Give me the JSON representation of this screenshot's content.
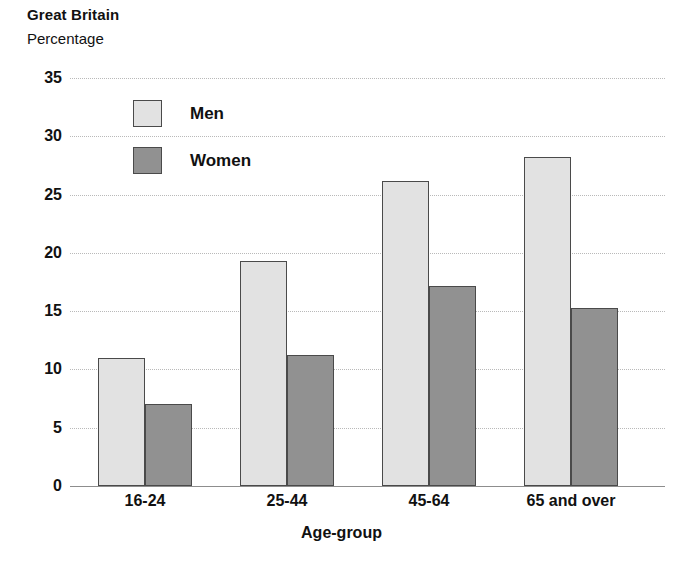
{
  "chart_data": {
    "type": "bar",
    "title": "Great Britain",
    "subtitle": "Percentage",
    "xlabel": "Age-group",
    "ylabel": "",
    "categories": [
      "16-24",
      "25-44",
      "45-64",
      "65 and over"
    ],
    "series": [
      {
        "name": "Men",
        "color": "#e2e2e2",
        "values": [
          11.0,
          19.3,
          26.2,
          28.2
        ]
      },
      {
        "name": "Women",
        "color": "#919191",
        "values": [
          7.0,
          11.2,
          17.2,
          15.3
        ]
      }
    ],
    "ylim": [
      0,
      35
    ],
    "yticks": [
      0,
      5,
      10,
      15,
      20,
      25,
      30,
      35
    ],
    "ytick_labels": [
      "0",
      "5",
      "10",
      "15",
      "20",
      "25",
      "30",
      "35"
    ],
    "grid": "horizontal-dotted",
    "legend_position": "inside-top-left",
    "legend": [
      "Men",
      "Women"
    ],
    "border_color": "#4a4a4a",
    "gridline_color": "#b9b9b9",
    "baseline_color": "#8d8d8d"
  }
}
